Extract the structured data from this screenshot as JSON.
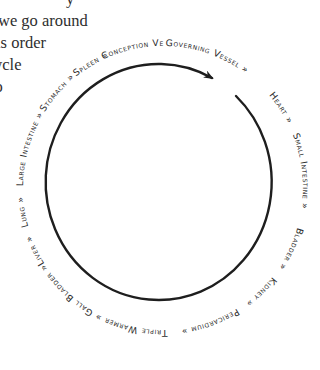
{
  "prose": {
    "lines": [
      "y",
      "we go around",
      "is order",
      "ycle",
      "to",
      ""
    ]
  },
  "diagram": {
    "type": "meridian-cycle",
    "direction": "clockwise",
    "separator": "»",
    "stroke_color": "#1e1e1e",
    "text_color": "#2b2b2b",
    "labels": [
      "Governing Vessel",
      "Heart",
      "Small Intestine",
      "Bladder",
      "Kidney",
      "Pericardium",
      "Triple Warmer",
      "Gall Bladder",
      "Liver",
      "Lung",
      "Large Intestine",
      "Stomach",
      "Spleen",
      "Conception Vessel"
    ],
    "label_text": {
      "governing_vessel": "Governing Vessel »",
      "heart": "Heart »",
      "small_intestine": "Small Intestine »",
      "bladder": "Bladder »",
      "kidney": "Kidney »",
      "pericardium": "Pericardium »",
      "triple_warmer": "Triple Warmer »",
      "gall_bladder": "Gall Bladder »",
      "liver": "Liver »",
      "lung": "Lung »",
      "large_intestine": "Large Intestine »",
      "stomach": "Stomach »",
      "spleen": "Spleen »",
      "conception_vessel": "Conception Vessel »"
    }
  }
}
